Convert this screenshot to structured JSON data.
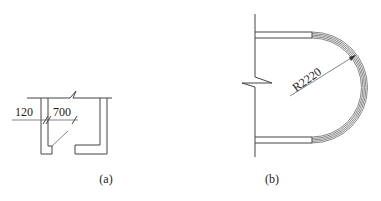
{
  "figure": {
    "panel_a": {
      "label": "(a)",
      "dimensions": {
        "wall_thickness": "120",
        "opening_width": "700"
      }
    },
    "panel_b": {
      "label": "(b)",
      "dimensions": {
        "radius": "R2220"
      }
    },
    "colors": {
      "line": "#444444",
      "background": "#ffffff"
    }
  }
}
